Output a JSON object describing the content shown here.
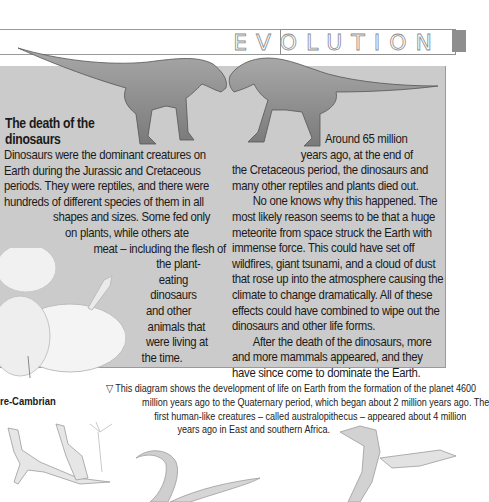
{
  "header": {
    "section_title": "EVOLUTION"
  },
  "article": {
    "heading_line1": "The death of the",
    "heading_line2": "dinosaurs",
    "left_column": [
      "Dinosaurs were the dominant creatures on",
      "Earth during the Jurassic and Cretaceous",
      "periods. They were reptiles, and there were",
      "hundreds of different species of them in all",
      "shapes and sizes. Some fed only",
      "on plants, while others ate",
      "meat – including the flesh of",
      "the plant-",
      "eating",
      "dinosaurs",
      "and other",
      "animals that",
      "were living at",
      "the time."
    ],
    "right_column": [
      "Around 65 million",
      "years ago, at the end of",
      "the Cretaceous period, the dinosaurs and",
      "many other reptiles and plants died out.",
      "No one knows why this happened. The",
      "most likely reason seems to be that a huge",
      "meteorite from space struck the Earth with",
      "immense force. This could have set off",
      "wildfires, giant tsunami, and a cloud of dust",
      "that rose up into the atmosphere causing the",
      "climate to change dramatically. All of these",
      "effects could have combined to wipe out the",
      "dinosaurs and other life forms.",
      "After the death of the dinosaurs, more",
      "and more mammals appeared, and they",
      "have since come to dominate the Earth."
    ]
  },
  "diagram": {
    "label_precambrian": "re-Cambrian",
    "caption_icon": "triangle-down-outline-icon",
    "caption_lines": [
      "▽ This diagram shows the development of life on Earth from the formation of the planet 4600",
      "million years ago to the Quaternary period, which began about 2 million years ago. The",
      "first human-like creatures – called australopithecus – appeared about 4 million",
      "years ago in East and southern Africa."
    ]
  },
  "colors": {
    "panel_gray": "#cbcbcb",
    "rule_gray": "#9a9a9a",
    "tab_gray": "#8e8e8e"
  }
}
